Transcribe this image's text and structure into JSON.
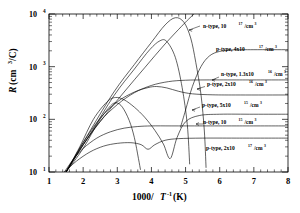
{
  "figure": {
    "background": "#ffffff",
    "line_color": "#000000"
  },
  "axes": {
    "x_title_main": "1000/",
    "x_title_italic": "T",
    "x_title_sup": "-1",
    "x_title_unit": "(K)",
    "x_ticks": [
      "1",
      "2",
      "3",
      "4",
      "5",
      "6",
      "7",
      "8"
    ],
    "y_title_italic": "R",
    "y_title_unit": "(cm",
    "y_title_sup": "3",
    "y_title_tail": "/C)",
    "y_ticks": [
      {
        "mantissa": "10",
        "exponent": "1"
      },
      {
        "mantissa": "10",
        "exponent": "2"
      },
      {
        "mantissa": "10",
        "exponent": "3"
      },
      {
        "mantissa": "10",
        "exponent": "4"
      }
    ]
  },
  "annotations": [
    {
      "id": "ann-n-1e17",
      "prefix": "n-type, 10",
      "sup1": "17",
      "mid": "/cm",
      "sup2": "3"
    },
    {
      "id": "ann-p-4e17",
      "prefix": "p-type, 4x10",
      "sup1": "17",
      "mid": "/cm",
      "sup2": "3"
    },
    {
      "id": "ann-n-1p3e16",
      "prefix": "n-type, 1.3x10",
      "sup1": "16",
      "mid": "/cm",
      "sup2": "3"
    },
    {
      "id": "ann-p-2e16",
      "prefix": "p-type, 2x10",
      "sup1": "16",
      "mid": "/cm",
      "sup2": "3"
    },
    {
      "id": "ann-p-5e15",
      "prefix": "p-type, 5x10",
      "sup1": "15",
      "mid": "/cm",
      "sup2": "3"
    },
    {
      "id": "ann-n-1e15",
      "prefix": "n-type, 10",
      "sup1": "15",
      "mid": "/cm",
      "sup2": "3"
    },
    {
      "id": "ann-p-2e17",
      "prefix": "p-type, 2x10",
      "sup1": "17",
      "mid": "/cm",
      "sup2": "3"
    }
  ],
  "chart_data": {
    "type": "line",
    "title": "",
    "xlabel": "1000/T^-1 (K)",
    "ylabel": "R (cm^3/C)",
    "xlim": [
      1,
      8
    ],
    "ylim": [
      10,
      10000
    ],
    "yscale": "log",
    "xscale": "linear",
    "grid": false,
    "legend": "inline-annotations",
    "x_ticks": [
      1,
      2,
      3,
      4,
      5,
      6,
      7,
      8
    ],
    "y_ticks": [
      10,
      100,
      1000,
      10000
    ],
    "series": [
      {
        "name": "n-type, 10^17/cm^3",
        "carrier": "n-type",
        "concentration": "10^17/cm^3",
        "saturation_R": 75,
        "note": "lowest plateau curve among n-type labelled set; flat from x~4.4 to 8",
        "points": [
          [
            1.45,
            10
          ],
          [
            1.7,
            17
          ],
          [
            2.0,
            28
          ],
          [
            2.4,
            44
          ],
          [
            2.8,
            58
          ],
          [
            3.2,
            68
          ],
          [
            3.6,
            73
          ],
          [
            4.0,
            75
          ],
          [
            4.6,
            75
          ],
          [
            5.5,
            75
          ],
          [
            6.5,
            75
          ],
          [
            8.0,
            75
          ]
        ]
      },
      {
        "name": "p-type, 2x10^17/cm^3",
        "carrier": "p-type",
        "concentration": "2x10^17/cm^3",
        "saturation_R": 44,
        "note": "lowest curve; dips near x~3.9 then plateaus",
        "points": [
          [
            1.45,
            10
          ],
          [
            1.8,
            16
          ],
          [
            2.2,
            24
          ],
          [
            2.6,
            31
          ],
          [
            3.0,
            35
          ],
          [
            3.4,
            36
          ],
          [
            3.7,
            33
          ],
          [
            3.9,
            27
          ],
          [
            4.1,
            33
          ],
          [
            4.4,
            40
          ],
          [
            4.8,
            43
          ],
          [
            5.5,
            44
          ],
          [
            6.5,
            44
          ],
          [
            8.0,
            44
          ]
        ]
      },
      {
        "name": "p-type, 5x10^15/cm^3",
        "carrier": "p-type",
        "concentration": "5x10^15/cm^3",
        "saturation_R": 125,
        "note": "peaks ~x=2.9 at R~260 then reverses sign dip near x=4.55 and recovers",
        "points": [
          [
            1.5,
            10
          ],
          [
            1.9,
            30
          ],
          [
            2.3,
            100
          ],
          [
            2.7,
            215
          ],
          [
            2.95,
            260
          ],
          [
            3.2,
            235
          ],
          [
            3.5,
            170
          ],
          [
            3.8,
            110
          ],
          [
            4.1,
            62
          ],
          [
            4.35,
            34
          ],
          [
            4.55,
            18
          ],
          [
            4.75,
            45
          ],
          [
            5.0,
            90
          ],
          [
            5.4,
            118
          ],
          [
            6.0,
            125
          ],
          [
            7.0,
            125
          ],
          [
            8.0,
            125
          ]
        ]
      },
      {
        "name": "n-type, 1.3x10^16/cm^3",
        "carrier": "n-type",
        "concentration": "1.3x10^16/cm^3",
        "saturation_R": 290,
        "note": "peaks ~x=4.15 at R~420 then falls into plateau",
        "points": [
          [
            1.5,
            10
          ],
          [
            2.0,
            36
          ],
          [
            2.5,
            105
          ],
          [
            3.0,
            215
          ],
          [
            3.5,
            330
          ],
          [
            3.9,
            400
          ],
          [
            4.15,
            420
          ],
          [
            4.45,
            395
          ],
          [
            4.8,
            340
          ],
          [
            5.2,
            305
          ],
          [
            5.8,
            292
          ],
          [
            6.6,
            290
          ],
          [
            8.0,
            290
          ]
        ]
      },
      {
        "name": "p-type, 2x10^16/cm^3",
        "carrier": "p-type",
        "concentration": "2x10^16/cm^3",
        "saturation_R": 560,
        "note": "rises monotonically into plateau near R~560",
        "points": [
          [
            1.5,
            10
          ],
          [
            2.0,
            33
          ],
          [
            2.5,
            92
          ],
          [
            3.0,
            190
          ],
          [
            3.5,
            320
          ],
          [
            4.0,
            440
          ],
          [
            4.5,
            520
          ],
          [
            5.0,
            553
          ],
          [
            5.6,
            560
          ],
          [
            6.5,
            560
          ],
          [
            8.0,
            560
          ]
        ]
      },
      {
        "name": "p-type, 4x10^17/cm^3",
        "carrier": "p-type",
        "concentration": "4x10^17/cm^3",
        "saturation_R": 2100,
        "note": "sharp rise after x~5.2 into high plateau R~2100",
        "points": [
          [
            4.85,
            70
          ],
          [
            5.0,
            150
          ],
          [
            5.2,
            420
          ],
          [
            5.45,
            1000
          ],
          [
            5.7,
            1600
          ],
          [
            6.0,
            1950
          ],
          [
            6.4,
            2080
          ],
          [
            7.0,
            2100
          ],
          [
            8.0,
            2100
          ]
        ]
      },
      {
        "name": "peak-curve-A",
        "carrier": "unlabelled",
        "concentration": "",
        "note": "tall peak ~x=4.7 reaching R~8500, then steep drop to bottom axis near x=4.6",
        "points": [
          [
            1.5,
            10
          ],
          [
            2.2,
            60
          ],
          [
            2.9,
            330
          ],
          [
            3.5,
            1100
          ],
          [
            4.0,
            2900
          ],
          [
            4.4,
            6200
          ],
          [
            4.7,
            8500
          ],
          [
            4.95,
            7000
          ],
          [
            5.15,
            3500
          ],
          [
            5.3,
            1200
          ],
          [
            5.45,
            300
          ],
          [
            5.55,
            60
          ],
          [
            5.6,
            12
          ]
        ]
      },
      {
        "name": "peak-curve-B",
        "carrier": "unlabelled",
        "concentration": "",
        "note": "drops steeply to axis near x=4.5",
        "points": [
          [
            1.5,
            10
          ],
          [
            2.2,
            52
          ],
          [
            2.9,
            280
          ],
          [
            3.5,
            900
          ],
          [
            3.95,
            2100
          ],
          [
            4.25,
            3100
          ],
          [
            4.45,
            3000
          ],
          [
            4.7,
            1500
          ],
          [
            4.9,
            400
          ],
          [
            5.05,
            80
          ],
          [
            5.12,
            14
          ]
        ]
      },
      {
        "name": "steep-line",
        "carrier": "unlabelled",
        "concentration": "",
        "note": "near-straight intrinsic line reaching top frame at x~5.25",
        "points": [
          [
            1.5,
            10
          ],
          [
            2.0,
            33
          ],
          [
            2.6,
            110
          ],
          [
            3.2,
            330
          ],
          [
            3.8,
            950
          ],
          [
            4.4,
            2700
          ],
          [
            5.0,
            7000
          ],
          [
            5.25,
            10000
          ]
        ]
      },
      {
        "name": "drop-curve-C",
        "carrier": "unlabelled",
        "concentration": "",
        "note": "peaks low ~x=2.95 then plunges to axis near x=3.65",
        "points": [
          [
            1.5,
            10
          ],
          [
            2.0,
            28
          ],
          [
            2.45,
            90
          ],
          [
            2.8,
            180
          ],
          [
            2.98,
            205
          ],
          [
            3.15,
            170
          ],
          [
            3.35,
            95
          ],
          [
            3.5,
            45
          ],
          [
            3.62,
            18
          ],
          [
            3.68,
            11
          ]
        ]
      }
    ]
  }
}
